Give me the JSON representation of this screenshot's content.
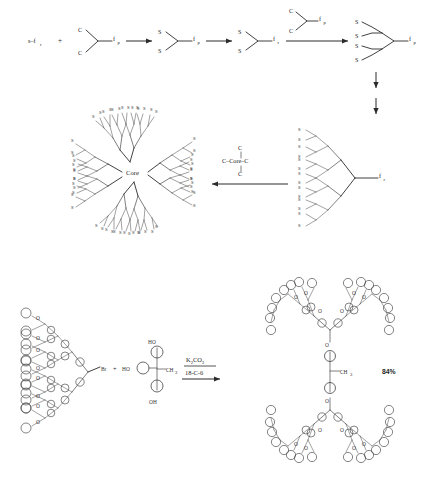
{
  "figure": {
    "type": "chemical-reaction-scheme"
  },
  "scheme_top": {
    "label": "divergent-dendrimer-growth",
    "reactant_a": {
      "text": "s–f",
      "sub": "r"
    },
    "plus_1": "+",
    "monomer_1": {
      "branch_top": "C",
      "branch_bottom": "C",
      "stem": "f",
      "stem_sub": "p"
    },
    "arrow_1": "→",
    "product_1": {
      "branch_top": "S",
      "branch_bottom": "S",
      "stem": "f",
      "stem_sub": "p"
    },
    "arrow_2": "→",
    "product_2": {
      "branch_top": "S",
      "branch_bottom": "S",
      "stem": "f",
      "stem_sub": "r"
    },
    "arrow_3": "→",
    "reagent_3": {
      "branch_top": "C",
      "branch_bottom": "C",
      "stem": "f",
      "stem_sub": "p"
    },
    "product_3": {
      "terminals": [
        "S",
        "S",
        "S",
        "S"
      ],
      "stem": "f",
      "stem_sub": "p"
    },
    "iteration_arrows": 2,
    "dendron": {
      "stem": "f",
      "stem_sub": "r",
      "terminal_atom": "S",
      "terminal_count": 16
    },
    "core_reagent": {
      "top": "C",
      "middle": "C–Core–C",
      "bottom": "C"
    },
    "arrow_left": "←",
    "dendrimer": {
      "core_label": "Core",
      "terminal_atom": "S",
      "terminal_count": 64,
      "generations": 4
    }
  },
  "scheme_bottom": {
    "label": "frechet-type-polyether-coupling",
    "dendron_left": {
      "terminal_group": "Br",
      "linker_atom": "O",
      "generations": 4
    },
    "plus": "+",
    "bisphenol": {
      "left_oh": "HO",
      "top_oh": "HO",
      "bottom_oh": "OH",
      "methyl": "CH",
      "methyl_sub": "3"
    },
    "reagent_top": {
      "text": "K",
      "sub1": "2",
      "text2": "CO",
      "sub2": "3"
    },
    "reagent_bottom": "18-C-6",
    "arrow": "→",
    "product": {
      "center_methyl": "CH",
      "center_methyl_sub": "3",
      "linker_atom": "O",
      "generations": 4
    },
    "yield": "84%"
  },
  "colors": {
    "ink": "#2b2b2b",
    "background": "#ffffff",
    "atom_text": "#262626"
  }
}
